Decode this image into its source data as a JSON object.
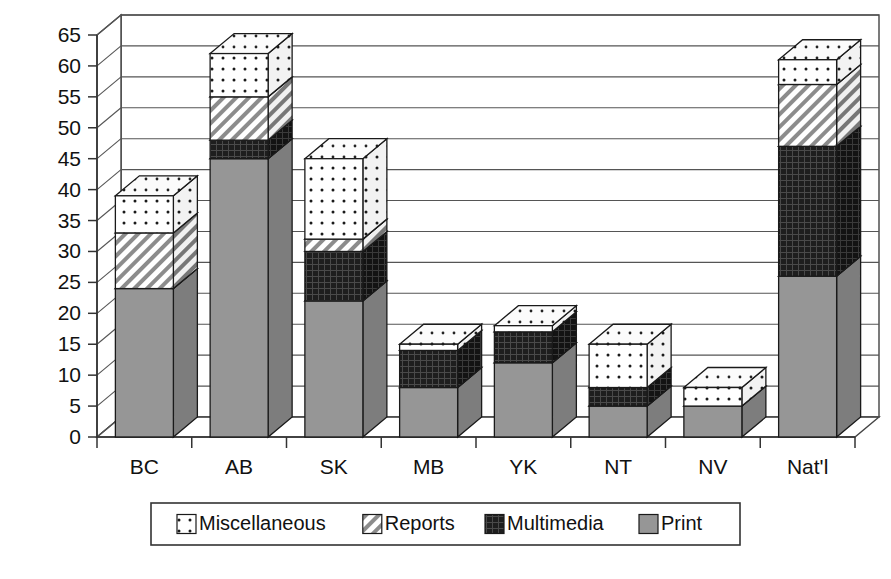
{
  "chart_data": {
    "type": "bar",
    "subtype": "stacked-column-3d",
    "title": "",
    "xlabel": "",
    "ylabel": "",
    "ylim": [
      0,
      65
    ],
    "ytick_step": 5,
    "yticks": [
      0,
      5,
      10,
      15,
      20,
      25,
      30,
      35,
      40,
      45,
      50,
      55,
      60,
      65
    ],
    "grid": true,
    "legend_position": "bottom",
    "categories": [
      "BC",
      "AB",
      "SK",
      "MB",
      "YK",
      "NT",
      "NV",
      "Nat'l"
    ],
    "series": [
      {
        "name": "Print",
        "pattern": "solid-gray",
        "color": "#969696",
        "values": [
          24,
          45,
          22,
          8,
          12,
          5,
          5,
          26
        ]
      },
      {
        "name": "Multimedia",
        "pattern": "dark-crosshatch",
        "color": "#1e1e1e",
        "values": [
          0,
          3,
          8,
          6,
          5,
          3,
          0,
          21
        ]
      },
      {
        "name": "Reports",
        "pattern": "diagonal-hatch",
        "color": "#ffffff",
        "values": [
          9,
          7,
          2,
          0,
          0,
          0,
          0,
          10
        ]
      },
      {
        "name": "Miscellaneous",
        "pattern": "dotted",
        "color": "#ffffff",
        "values": [
          6,
          7,
          13,
          1,
          1,
          7,
          3,
          4
        ]
      }
    ],
    "totals": [
      39,
      62,
      45,
      15,
      18,
      15,
      8,
      61
    ],
    "legend_order": [
      "Miscellaneous",
      "Reports",
      "Multimedia",
      "Print"
    ]
  },
  "axis": {
    "tick_labels": [
      "65",
      "60",
      "55",
      "50",
      "45",
      "40",
      "35",
      "30",
      "25",
      "20",
      "15",
      "10",
      "5",
      "0"
    ]
  },
  "legend": {
    "entries": [
      {
        "label": "Miscellaneous",
        "swatch": "dotted-swatch-icon"
      },
      {
        "label": "Reports",
        "swatch": "hatch-swatch-icon"
      },
      {
        "label": "Multimedia",
        "swatch": "dark-swatch-icon"
      },
      {
        "label": "Print",
        "swatch": "gray-swatch-icon"
      }
    ]
  }
}
